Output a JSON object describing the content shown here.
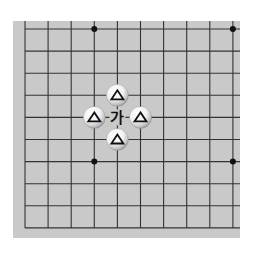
{
  "diagram": {
    "type": "go-board-section",
    "grid": {
      "columns": 10,
      "rows": 10,
      "origin_x": 25,
      "origin_y": 29,
      "step_x": 23.1,
      "step_y": 22.1,
      "open_edges": [
        "top",
        "right"
      ]
    },
    "colors": {
      "board": "#c9c9c9",
      "line": "#333333",
      "star": "#111111",
      "stone_white": "#ffffff",
      "mark": "#111111"
    },
    "star_points": [
      {
        "col": 3,
        "row": 0
      },
      {
        "col": 9,
        "row": 0
      },
      {
        "col": 3,
        "row": 6
      },
      {
        "col": 9,
        "row": 6
      }
    ],
    "stones": [
      {
        "color": "white",
        "col": 4,
        "row": 3,
        "mark": "△"
      },
      {
        "color": "white",
        "col": 3,
        "row": 4,
        "mark": "△"
      },
      {
        "color": "white",
        "col": 5,
        "row": 4,
        "mark": "△"
      },
      {
        "color": "white",
        "col": 4,
        "row": 5,
        "mark": "△"
      }
    ],
    "labels": [
      {
        "col": 4,
        "row": 4,
        "text": "가"
      }
    ]
  }
}
